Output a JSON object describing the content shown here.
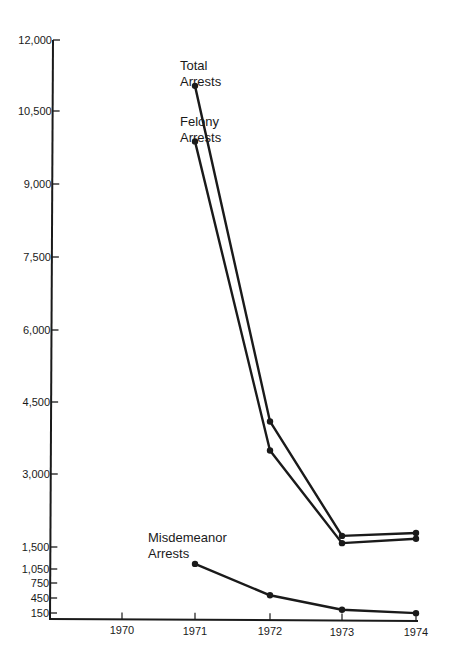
{
  "chart_data": {
    "type": "line",
    "title": "",
    "xlabel": "",
    "ylabel": "",
    "x": [
      "1970",
      "1971",
      "1972",
      "1973",
      "1974"
    ],
    "ylim": [
      0,
      12000
    ],
    "y_ticks": [
      "12,000",
      "10,500",
      "9,000",
      "7,500",
      "6,000",
      "4,500",
      "3,000",
      "1,500",
      "1,050",
      "750",
      "450",
      "150"
    ],
    "x_ticks": [
      "1970",
      "1971",
      "1972",
      "1973",
      "1974"
    ],
    "grid": false,
    "legend": "inline labels",
    "series": [
      {
        "name": "Total Arrests",
        "label_lines": [
          "Total",
          "Arrests"
        ],
        "x": [
          "1971",
          "1972",
          "1973",
          "1974"
        ],
        "values": [
          11050,
          4100,
          1730,
          1790
        ]
      },
      {
        "name": "Felony Arrests",
        "label_lines": [
          "Felony",
          "Arrests"
        ],
        "x": [
          "1971",
          "1972",
          "1973",
          "1974"
        ],
        "values": [
          9900,
          3500,
          1580,
          1670
        ]
      },
      {
        "name": "Misdemeanor Arrests",
        "label_lines": [
          "Misdemeanor",
          "Arrests"
        ],
        "x": [
          "1971",
          "1972",
          "1973",
          "1974"
        ],
        "values": [
          1150,
          500,
          200,
          130
        ]
      }
    ]
  }
}
